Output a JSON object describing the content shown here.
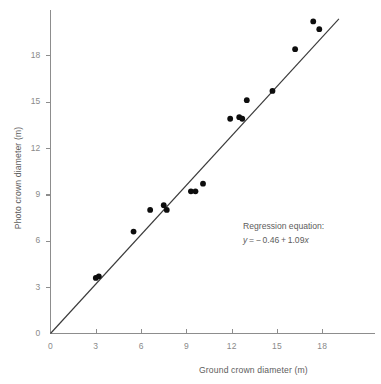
{
  "chart_data": {
    "type": "scatter",
    "title": "",
    "xlabel": "Ground crown diameter (m)",
    "ylabel": "Photo crown diameter (m)",
    "xlim": [
      0,
      22
    ],
    "ylim": [
      0,
      21.5
    ],
    "xticks": [
      0,
      3,
      6,
      9,
      12,
      15,
      18
    ],
    "xtick_labels": [
      "0",
      "3",
      "6",
      "9",
      "12",
      "15",
      "18"
    ],
    "yticks": [
      0,
      3,
      6,
      9,
      12,
      15,
      18
    ],
    "ytick_labels": [
      "0",
      "3",
      "6",
      "9",
      "12",
      "15",
      "18"
    ],
    "grid": false,
    "legend": null,
    "points": [
      {
        "x": 3.0,
        "y": 3.6
      },
      {
        "x": 3.2,
        "y": 3.7
      },
      {
        "x": 5.5,
        "y": 6.6
      },
      {
        "x": 6.6,
        "y": 8.0
      },
      {
        "x": 7.5,
        "y": 8.3
      },
      {
        "x": 7.7,
        "y": 8.0
      },
      {
        "x": 9.3,
        "y": 9.2
      },
      {
        "x": 9.6,
        "y": 9.2
      },
      {
        "x": 10.1,
        "y": 9.7
      },
      {
        "x": 11.9,
        "y": 13.9
      },
      {
        "x": 12.5,
        "y": 14.0
      },
      {
        "x": 12.7,
        "y": 13.9
      },
      {
        "x": 13.0,
        "y": 15.1
      },
      {
        "x": 14.7,
        "y": 15.7
      },
      {
        "x": 16.2,
        "y": 18.4
      },
      {
        "x": 17.4,
        "y": 20.2
      },
      {
        "x": 17.8,
        "y": 19.7
      }
    ],
    "regression": {
      "intercept": -0.46,
      "slope": 1.09,
      "label": "Regression equation:",
      "equation": "y = − 0.46 + 1.09x",
      "equation_variable_y": "y",
      "equation_body": " =  − 0.46 + 1.09",
      "equation_variable_x": "x",
      "x_start": 0.0,
      "x_end": 19.1
    }
  },
  "annotation": {
    "title": "Regression equation:",
    "equation_y": "y",
    "equation_mid": " = − 0.46 + 1.09",
    "equation_x": "x"
  },
  "colors": {
    "point": "#0d0d0d",
    "line": "#3a3a3a",
    "axis": "#8d8d8d",
    "tick_text": "#8a8a8a",
    "label_text": "#5d5d5d",
    "background": "#ffffff"
  }
}
